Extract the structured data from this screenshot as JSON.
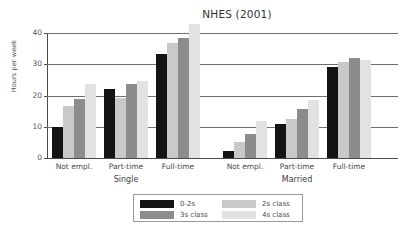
{
  "chart_data": {
    "type": "bar",
    "title": "NHES (2001)",
    "xlabel": "",
    "ylabel": "Hours per week",
    "ylim": [
      0,
      40
    ],
    "yticks": [
      0,
      10,
      20,
      30,
      40
    ],
    "ytick_labels": [
      "0",
      "10",
      "20",
      "30",
      "40"
    ],
    "grid": true,
    "legend_position": "bottom",
    "group_labels": [
      "Single",
      "Married"
    ],
    "categories": [
      "Not empl.",
      "Part-time",
      "Full-time",
      "Not empl.",
      "Part-time",
      "Full-time"
    ],
    "series": [
      {
        "name": "0-2s",
        "color": "#141414",
        "values": [
          10.0,
          22.0,
          33.2,
          2.1,
          10.8,
          29.0
        ]
      },
      {
        "name": "2s class",
        "color": "#c9c9c9",
        "values": [
          16.6,
          19.3,
          36.8,
          5.2,
          12.4,
          30.6
        ]
      },
      {
        "name": "3s class",
        "color": "#8c8c8c",
        "values": [
          18.9,
          23.6,
          38.3,
          7.8,
          15.6,
          32.0
        ]
      },
      {
        "name": "4s class",
        "color": "#e2e2e2",
        "values": [
          23.6,
          24.8,
          42.8,
          12.0,
          18.6,
          31.4
        ]
      }
    ]
  },
  "legend": {
    "items": [
      {
        "label": "0-2s"
      },
      {
        "label": "2s class"
      },
      {
        "label": "3s class"
      },
      {
        "label": "4s class"
      }
    ]
  }
}
